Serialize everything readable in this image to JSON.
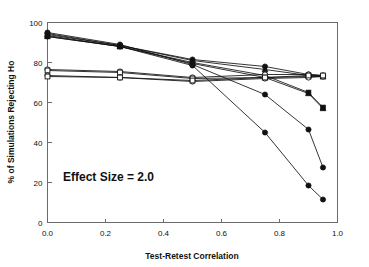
{
  "chart_data": {
    "type": "line",
    "title": "",
    "xlabel": "Test-Retest Correlation",
    "ylabel": "% of Simulations Rejecting Ho",
    "xlim": [
      0.0,
      1.0
    ],
    "ylim": [
      0,
      100
    ],
    "xticks": [
      0.0,
      0.2,
      0.4,
      0.6,
      0.8,
      1.0
    ],
    "xticklabels": [
      "0.0",
      "0.2",
      "0.4",
      "0.6",
      "0.8",
      "1.0"
    ],
    "yticks": [
      0,
      20,
      40,
      60,
      80,
      100
    ],
    "yticklabels": [
      "0",
      "20",
      "40",
      "60",
      "80",
      "100"
    ],
    "grid": false,
    "legend": "none",
    "annotations": [
      {
        "text": "Effect Size = 2.0",
        "x": 0.08,
        "y": 22
      }
    ],
    "x": [
      0.0,
      0.25,
      0.5,
      0.75,
      0.9,
      0.95
    ],
    "series": [
      {
        "name": "series-1",
        "marker": "filled-circle",
        "values": [
          94.5,
          88.5,
          81.5,
          78.0,
          74.0,
          73.5
        ]
      },
      {
        "name": "series-2",
        "marker": "filled-triangle",
        "values": [
          94.0,
          88.5,
          81.0,
          76.5,
          73.5,
          73.0
        ]
      },
      {
        "name": "series-3",
        "marker": "filled-square",
        "values": [
          93.5,
          88.0,
          80.0,
          73.5,
          65.0,
          57.5
        ]
      },
      {
        "name": "series-4",
        "marker": "filled-triangle",
        "values": [
          93.0,
          88.0,
          79.5,
          72.5,
          64.5,
          57.0
        ]
      },
      {
        "name": "series-5",
        "marker": "filled-circle",
        "values": [
          95.0,
          89.0,
          79.0,
          64.0,
          46.5,
          27.5
        ]
      },
      {
        "name": "series-6",
        "marker": "filled-circle",
        "values": [
          93.0,
          88.0,
          78.5,
          45.0,
          18.5,
          11.5
        ]
      },
      {
        "name": "series-7",
        "marker": "open-circle",
        "values": [
          76.5,
          75.5,
          72.5,
          74.0,
          74.0,
          73.5
        ]
      },
      {
        "name": "series-8",
        "marker": "open-square",
        "values": [
          76.0,
          75.0,
          72.0,
          72.5,
          73.0,
          73.0
        ]
      },
      {
        "name": "series-9",
        "marker": "open-circle",
        "values": [
          73.5,
          72.5,
          70.5,
          72.0,
          72.5,
          73.0
        ]
      },
      {
        "name": "series-10",
        "marker": "open-square",
        "values": [
          73.0,
          72.5,
          71.0,
          72.5,
          73.5,
          73.5
        ]
      }
    ]
  }
}
